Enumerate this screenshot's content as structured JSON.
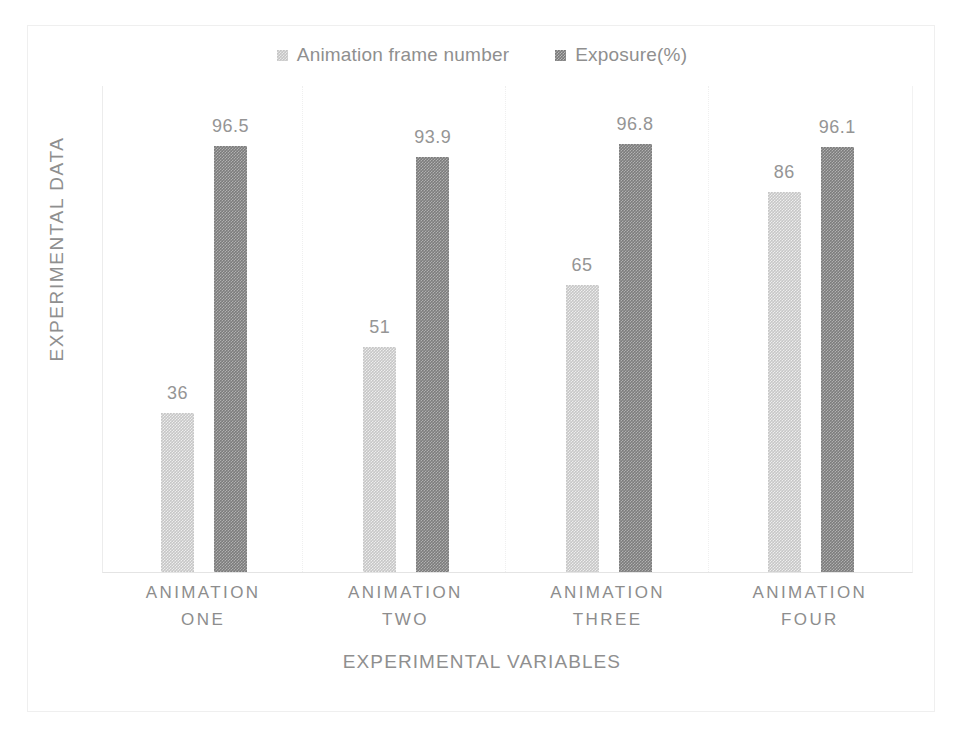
{
  "chart_data": {
    "type": "bar",
    "title": "",
    "subtitle": "",
    "categories": [
      "ANIMATION ONE",
      "ANIMATION TWO",
      "ANIMATION THREE",
      "ANIMATION FOUR"
    ],
    "category_lines": [
      [
        "ANIMATION",
        "ONE"
      ],
      [
        "ANIMATION",
        "TWO"
      ],
      [
        "ANIMATION",
        "THREE"
      ],
      [
        "ANIMATION",
        "FOUR"
      ]
    ],
    "series": [
      {
        "name": "Animation frame number",
        "color": "#c6c6c6",
        "values": [
          36,
          51,
          65,
          86
        ],
        "labels": [
          "36",
          "51",
          "65",
          "86"
        ]
      },
      {
        "name": "Exposure(%)",
        "color": "#7c7c7c",
        "values": [
          96.5,
          93.9,
          96.8,
          96.1
        ],
        "labels": [
          "96.5",
          "93.9",
          "96.8",
          "96.1"
        ]
      }
    ],
    "xlabel": "EXPERIMENTAL VARIABLES",
    "ylabel": "EXPERIMENTAL DATA",
    "ylim": [
      0,
      110
    ],
    "y_tick_labels": [],
    "grid": false,
    "category_separators": true,
    "legend_position": "top-center",
    "data_labels": true
  },
  "axes": {
    "y_title": "EXPERIMENTAL DATA",
    "x_title": "EXPERIMENTAL VARIABLES"
  },
  "legend": {
    "entries": [
      {
        "label": "Animation frame number",
        "swatch": "series-light"
      },
      {
        "label": "Exposure(%)",
        "swatch": "series-dark"
      }
    ]
  }
}
